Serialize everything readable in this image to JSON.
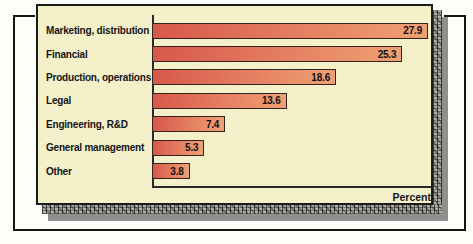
{
  "figure": {
    "background_color": "#fdfdfa",
    "bracket_color": "#151515",
    "shadow_gray_color": "#8f8f8f"
  },
  "panel": {
    "background_color": "#f4f0ca",
    "border_color": "#1b1b1b"
  },
  "chart_data": {
    "type": "bar",
    "orientation": "horizontal",
    "title": "",
    "categories": [
      "Marketing, distribution",
      "Financial",
      "Production, operations",
      "Legal",
      "Engineering, R&D",
      "General management",
      "Other"
    ],
    "values": [
      27.9,
      25.3,
      18.6,
      13.6,
      7.4,
      5.3,
      3.8
    ],
    "xlabel": "Percent",
    "ylabel": "",
    "xlim": [
      0,
      28.2
    ],
    "grid": false,
    "legend": "none",
    "value_labels_position": "inside-end",
    "bar_color_left": "#d8584c",
    "bar_color_right": "#efa173",
    "bar_border_color": "#33231a",
    "value_label_color": "#101010",
    "axis_color": "#2a2a2a"
  }
}
